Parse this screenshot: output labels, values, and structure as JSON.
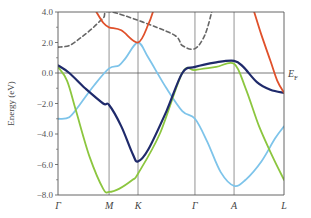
{
  "chart_data": {
    "type": "line",
    "title": "",
    "xlabel": "",
    "ylabel": "Energy (eV)",
    "ylim": [
      -8.0,
      4.0
    ],
    "yticks": [
      "4.0",
      "2.0",
      "0.0",
      "-2.0",
      "-4.0",
      "-6.0",
      "-8.0"
    ],
    "ytick_values": [
      4.0,
      2.0,
      0.0,
      -2.0,
      -4.0,
      -6.0,
      -8.0
    ],
    "k_points": [
      "Γ",
      "M",
      "K",
      "Γ",
      "A",
      "L"
    ],
    "k_positions": [
      0,
      0.226,
      0.354,
      0.606,
      0.779,
      1.0
    ],
    "fermi_label": "E",
    "fermi_sub": "F",
    "grid": "vertical lines at high-symmetry points; horizontal line at E_F",
    "colors": {
      "red": "#e0502a",
      "dark_blue": "#1f2a6b",
      "light_blue": "#7ec4ea",
      "green": "#8cc63f",
      "gray_dashed": "#666666",
      "axis": "#555555"
    },
    "series": [
      {
        "name": "red band (left)",
        "color": "red",
        "x": [
          0.17,
          0.2,
          0.226,
          0.28,
          0.354,
          0.4,
          0.42
        ],
        "y": [
          4.0,
          3.3,
          3.0,
          2.8,
          2.0,
          3.2,
          4.0
        ]
      },
      {
        "name": "red band (right)",
        "color": "red",
        "x": [
          0.868,
          0.9,
          0.94,
          0.97,
          1.0
        ],
        "y": [
          4.0,
          2.5,
          0.8,
          -0.5,
          -1.3
        ]
      },
      {
        "name": "gray dashed band",
        "color": "gray_dashed",
        "dashed": true,
        "x": [
          0,
          0.05,
          0.1,
          0.15,
          0.2,
          0.24,
          0.5,
          0.55,
          0.606,
          0.65,
          0.68
        ],
        "y": [
          1.7,
          1.8,
          2.3,
          2.9,
          3.6,
          4.0,
          2.6,
          1.8,
          1.6,
          2.5,
          4.0
        ]
      },
      {
        "name": "dark blue band",
        "color": "dark_blue",
        "x": [
          0,
          0.05,
          0.12,
          0.2,
          0.226,
          0.28,
          0.33,
          0.354,
          0.4,
          0.48,
          0.55,
          0.606,
          0.7,
          0.779,
          0.82,
          0.88,
          0.94,
          1.0
        ],
        "y": [
          0.5,
          0.0,
          -1.0,
          -2.0,
          -2.1,
          -3.5,
          -5.3,
          -5.8,
          -5.0,
          -2.5,
          0.0,
          0.4,
          0.7,
          0.8,
          0.4,
          -0.6,
          -1.1,
          -1.3
        ]
      },
      {
        "name": "green band",
        "color": "green",
        "x": [
          0,
          0.04,
          0.08,
          0.14,
          0.2,
          0.226,
          0.27,
          0.33,
          0.354,
          0.45,
          0.55,
          0.606,
          0.7,
          0.779,
          0.83,
          0.89,
          0.95,
          1.0
        ],
        "y": [
          0.4,
          -0.5,
          -2.5,
          -5.5,
          -7.6,
          -7.8,
          -7.6,
          -7.0,
          -6.6,
          -4.0,
          0.0,
          0.2,
          0.4,
          0.6,
          -1.0,
          -3.5,
          -5.5,
          -7.0
        ]
      },
      {
        "name": "light blue band",
        "color": "light_blue",
        "x": [
          0,
          0.05,
          0.1,
          0.16,
          0.226,
          0.27,
          0.3,
          0.354,
          0.4,
          0.48,
          0.55,
          0.606,
          0.66,
          0.72,
          0.779,
          0.83,
          0.9,
          0.96,
          1.0
        ],
        "y": [
          -3.0,
          -2.9,
          -2.0,
          -0.8,
          0.3,
          0.5,
          1.0,
          2.0,
          1.0,
          -1.0,
          -2.5,
          -3.0,
          -4.5,
          -6.5,
          -7.4,
          -7.0,
          -5.8,
          -4.3,
          -3.5
        ]
      }
    ]
  }
}
